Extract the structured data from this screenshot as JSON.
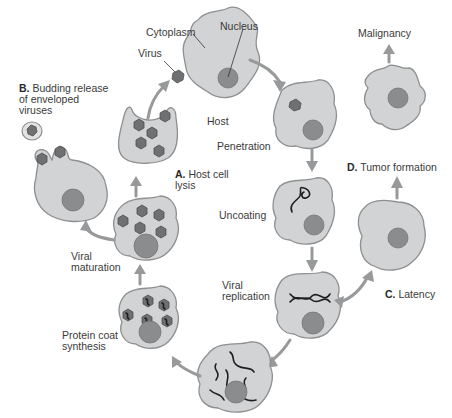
{
  "diagram": {
    "colors": {
      "background": "#ffffff",
      "cell_fill": "#d2d3d4",
      "cell_outline": "#8e8f90",
      "nucleus": "#8b8c8d",
      "virus": "#6f7071",
      "arrow": "#98999a",
      "text": "#3a3a3a"
    },
    "labels": {
      "cytoplasm": "Cytoplasm",
      "nucleus": "Nucleus",
      "virus": "Virus",
      "host": "Host",
      "penetration": "Penetration",
      "uncoating": "Uncoating",
      "viral_replication": [
        "Viral",
        "replication"
      ],
      "protein_coat_synthesis": [
        "Protein coat",
        "synthesis"
      ],
      "viral_maturation": [
        "Viral",
        "maturation"
      ],
      "host_cell_lysis": {
        "letter": "A.",
        "text": [
          "Host cell",
          "lysis"
        ]
      },
      "budding_release": {
        "letter": "B.",
        "text": [
          "Budding release",
          "of enveloped",
          "viruses"
        ]
      },
      "latency": {
        "letter": "C.",
        "text": "Latency"
      },
      "tumor_formation": {
        "letter": "D.",
        "text": "Tumor formation"
      },
      "malignancy": "Malignancy"
    },
    "stages": [
      "Host",
      "Penetration",
      "Uncoating",
      "Viral replication",
      "Protein coat synthesis",
      "Viral maturation",
      "A. Host cell lysis",
      "B. Budding release of enveloped viruses",
      "C. Latency",
      "D. Tumor formation",
      "Malignancy"
    ]
  }
}
